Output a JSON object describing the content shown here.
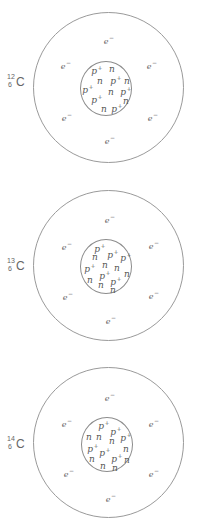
{
  "colors": {
    "line": "#9a9a9a",
    "text": "#555555",
    "background": "#ffffff"
  },
  "atoms": [
    {
      "isotope": {
        "mass_number": "12",
        "atomic_number": "6",
        "symbol": "C"
      },
      "protons": 6,
      "neutrons": 6,
      "electrons": 6,
      "electron_label": "e",
      "electron_charge": "−",
      "proton_label": "p",
      "proton_charge": "+",
      "neutron_label": "n"
    },
    {
      "isotope": {
        "mass_number": "13",
        "atomic_number": "6",
        "symbol": "C"
      },
      "protons": 6,
      "neutrons": 7,
      "electrons": 6,
      "electron_label": "e",
      "electron_charge": "−",
      "proton_label": "p",
      "proton_charge": "+",
      "neutron_label": "n"
    },
    {
      "isotope": {
        "mass_number": "14",
        "atomic_number": "6",
        "symbol": "C"
      },
      "protons": 6,
      "neutrons": 8,
      "electrons": 6,
      "electron_label": "e",
      "electron_charge": "−",
      "proton_label": "p",
      "proton_charge": "+",
      "neutron_label": "n"
    }
  ]
}
